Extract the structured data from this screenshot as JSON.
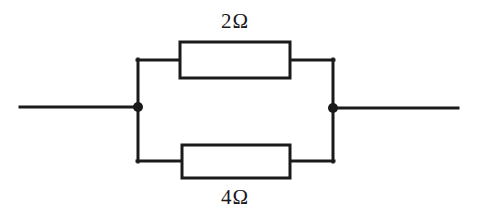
{
  "diagram": {
    "background_color": "#ffffff",
    "line_color": "#1a1a1a",
    "line_width": 3,
    "node_color": "#1a1a1a",
    "node_radius": 5
  },
  "labels": {
    "top_resistor": "2Ω",
    "bottom_resistor": "4Ω"
  },
  "components": {
    "top_resistor": {
      "name": "resistor-2-ohm",
      "value": "2Ω",
      "x": 180,
      "y": 42,
      "width": 110,
      "height": 36
    },
    "bottom_resistor": {
      "name": "resistor-4-ohm",
      "value": "4Ω",
      "x": 182,
      "y": 145,
      "width": 108,
      "height": 33
    },
    "left_node": {
      "cx": 138,
      "cy": 107,
      "r": 5
    },
    "right_node": {
      "cx": 333,
      "cy": 108,
      "r": 5
    }
  },
  "wires": {
    "left_lead": {
      "x1": 20,
      "y1": 107,
      "x2": 138,
      "y2": 107
    },
    "right_lead": {
      "x1": 333,
      "y1": 108,
      "x2": 458,
      "y2": 108
    },
    "left_vertical": {
      "x1": 138,
      "y1": 60,
      "x2": 138,
      "y2": 161
    },
    "right_vertical": {
      "x1": 333,
      "y1": 60,
      "x2": 333,
      "y2": 161
    },
    "top_branch_left": {
      "x1": 138,
      "y1": 60,
      "x2": 180,
      "y2": 60
    },
    "top_branch_right": {
      "x1": 290,
      "y1": 60,
      "x2": 333,
      "y2": 60
    },
    "bottom_branch_left": {
      "x1": 138,
      "y1": 161,
      "x2": 182,
      "y2": 161
    },
    "bottom_branch_right": {
      "x1": 290,
      "y1": 161,
      "x2": 333,
      "y2": 161
    }
  }
}
